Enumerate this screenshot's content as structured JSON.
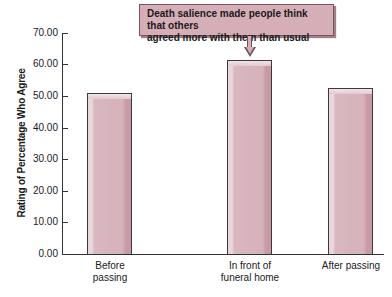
{
  "chart_data": {
    "type": "bar",
    "title": "",
    "xlabel": "",
    "ylabel": "Rating of Percentage Who Agree",
    "ylim": [
      0,
      70
    ],
    "yticks": [
      "0.00",
      "10.00",
      "20.00",
      "30.00",
      "40.00",
      "50.00",
      "60.00",
      "70.00"
    ],
    "categories": [
      "Before passing",
      "In front of funeral home",
      "After passing"
    ],
    "category_lines": [
      [
        "Before",
        "passing"
      ],
      [
        "In front of",
        "funeral home"
      ],
      [
        "After passing"
      ]
    ],
    "values": [
      51.0,
      61.5,
      52.7
    ],
    "grid": false,
    "legend": null,
    "bar_color": "#d6b2bb",
    "annotations": [
      {
        "text_lines": [
          "Death salience made people think that others",
          "agreed more with them than usual"
        ],
        "target_category": "In front of funeral home",
        "box_color": "#d6aeb8"
      }
    ]
  }
}
